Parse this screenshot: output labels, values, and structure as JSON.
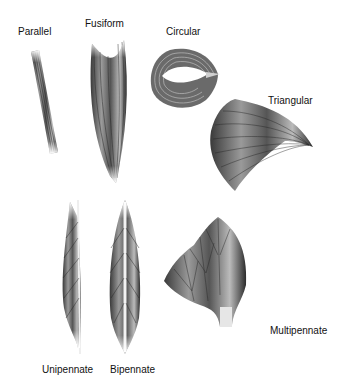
{
  "diagram": {
    "labels": {
      "parallel": "Parallel",
      "fusiform": "Fusiform",
      "circular": "Circular",
      "triangular": "Triangular",
      "unipennate": "Unipennate",
      "bipennate": "Bipennate",
      "multipennate": "Multipennate"
    },
    "colors": {
      "fiber_dark": "#2a2a2a",
      "fiber_mid": "#777777",
      "fiber_light": "#cfcfcf",
      "background": "#ffffff"
    }
  }
}
